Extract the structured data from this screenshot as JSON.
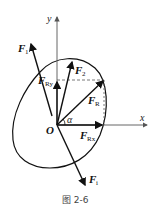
{
  "figure": {
    "caption": "图 2-6",
    "origin_label": "O",
    "x_axis_label": "x",
    "y_axis_label": "y",
    "angle_label": "α",
    "forces": [
      {
        "name": "F",
        "sub": "1"
      },
      {
        "name": "F",
        "sub": "2"
      },
      {
        "name": "F",
        "sub": "R"
      },
      {
        "name": "F",
        "sub": "Ry"
      },
      {
        "name": "F",
        "sub": "Rx"
      },
      {
        "name": "F",
        "sub": "i"
      }
    ],
    "colors": {
      "line": "#111111",
      "dash": "#555555",
      "axis": "#555555"
    }
  }
}
